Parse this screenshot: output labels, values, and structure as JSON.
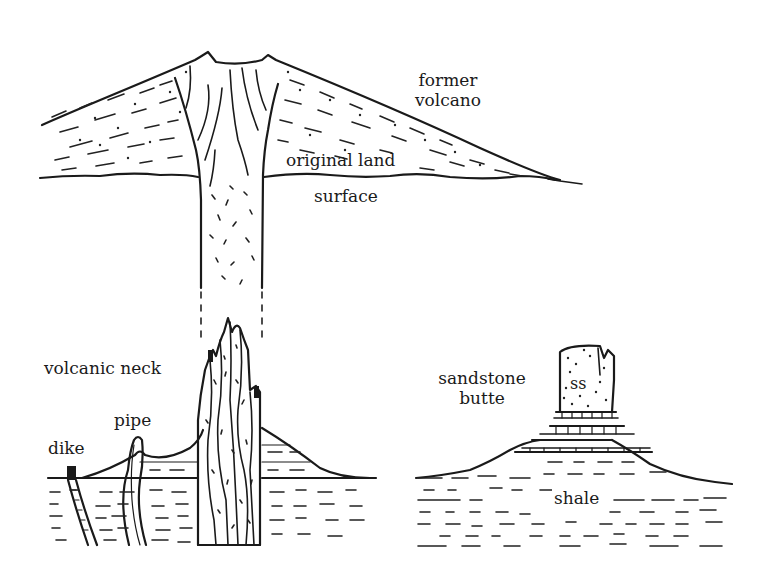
{
  "diagram": {
    "colors": {
      "ink": "#1a1a1a",
      "background": "#ffffff"
    },
    "labels": {
      "former_volcano_line1": "former",
      "former_volcano_line2": "volcano",
      "original_land": "original land",
      "surface": "surface",
      "volcanic_neck": "volcanic neck",
      "pipe": "pipe",
      "dike": "dike",
      "sandstone_line1": "sandstone",
      "sandstone_line2": "butte",
      "ss": "ss",
      "shale": "shale"
    },
    "panels": [
      {
        "id": "former-volcano",
        "position": "top",
        "labels": [
          "former volcano",
          "original land surface"
        ]
      },
      {
        "id": "volcanic-neck",
        "position": "bottom-left",
        "labels": [
          "volcanic neck",
          "pipe",
          "dike"
        ]
      },
      {
        "id": "sandstone-butte",
        "position": "bottom-right",
        "labels": [
          "sandstone butte",
          "ss",
          "shale"
        ]
      }
    ]
  }
}
